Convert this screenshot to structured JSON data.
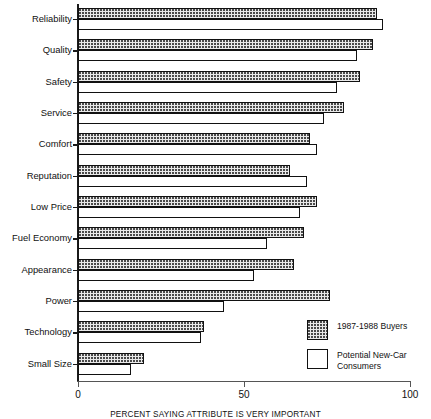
{
  "chart_data": {
    "type": "bar",
    "orientation": "horizontal",
    "title": "",
    "xlabel": "PERCENT SAYING ATTRIBUTE IS VERY IMPORTANT",
    "ylabel": "",
    "xlim": [
      0,
      100
    ],
    "xticks": [
      0,
      50,
      100
    ],
    "xticklabels": [
      "0",
      "50",
      "100"
    ],
    "grid": false,
    "legend_position": "inside-lower-right",
    "categories": [
      "Reliability",
      "Quality",
      "Safety",
      "Service",
      "Comfort",
      "Reputation",
      "Low Price",
      "Fuel Economy",
      "Appearance",
      "Power",
      "Technology",
      "Small Size"
    ],
    "series": [
      {
        "name": "1987-1988 Buyers",
        "fill": "dotted",
        "values": [
          90,
          89,
          85,
          80,
          70,
          64,
          72,
          68,
          65,
          76,
          38,
          20
        ]
      },
      {
        "name": "Potential New-Car Consumers",
        "fill": "white",
        "values": [
          92,
          84,
          78,
          74,
          72,
          69,
          67,
          57,
          53,
          44,
          37,
          16
        ]
      }
    ]
  },
  "legend": {
    "items": [
      {
        "label": "1987-1988 Buyers",
        "swatch": "dotted-swatch"
      },
      {
        "label": "Potential New-Car Consumers",
        "swatch": "white-swatch"
      }
    ]
  },
  "axis": {
    "x_tick_labels": [
      "0",
      "50",
      "100"
    ],
    "x_title": "PERCENT SAYING ATTRIBUTE IS VERY IMPORTANT"
  },
  "colors": {
    "ink": "#111111",
    "axis": "#555555",
    "dotted_fill": "#e9e9e9",
    "dot": "#4a4a4a",
    "background": "#ffffff"
  }
}
